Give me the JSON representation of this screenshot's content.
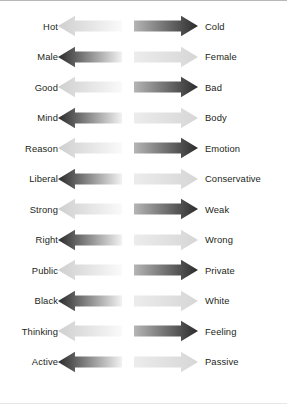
{
  "figure": {
    "type": "dichotomy-arrow-diagram",
    "orientation": "horizontal",
    "arrow_style": "double-headed-gradient",
    "top_rule_color": "#b8b8b8",
    "bottom_rule_color": "#e6e6e6",
    "text_color": "#231f20",
    "gradient_dark": "#2b2b2b",
    "gradient_light": "#f2f2f2",
    "gradient_mid": "#9a9a9a"
  },
  "rows": [
    {
      "left": "Hot",
      "right": "Cold",
      "direction": "light-to-dark"
    },
    {
      "left": "Male",
      "right": "Female",
      "direction": "dark-to-light"
    },
    {
      "left": "Good",
      "right": "Bad",
      "direction": "light-to-dark"
    },
    {
      "left": "Mind",
      "right": "Body",
      "direction": "dark-to-light"
    },
    {
      "left": "Reason",
      "right": "Emotion",
      "direction": "light-to-dark"
    },
    {
      "left": "Liberal",
      "right": "Conservative",
      "direction": "dark-to-light"
    },
    {
      "left": "Strong",
      "right": "Weak",
      "direction": "light-to-dark"
    },
    {
      "left": "Right",
      "right": "Wrong",
      "direction": "dark-to-light"
    },
    {
      "left": "Public",
      "right": "Private",
      "direction": "light-to-dark"
    },
    {
      "left": "Black",
      "right": "White",
      "direction": "dark-to-light"
    },
    {
      "left": "Thinking",
      "right": "Feeling",
      "direction": "light-to-dark"
    },
    {
      "left": "Active",
      "right": "Passive",
      "direction": "dark-to-light"
    }
  ]
}
